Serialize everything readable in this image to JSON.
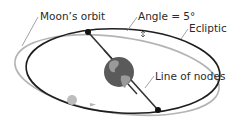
{
  "diagram": {
    "labels": {
      "moons_orbit": "Moon’s orbit",
      "angle": "Angle = 5°",
      "ecliptic": "Ecliptic",
      "line_of_nodes": "Line of nodes"
    },
    "colors": {
      "ecliptic": "#1e1e1e",
      "moon_orbit": "#b4b4b4",
      "earth": "#5a5a5a",
      "earth_land": "#9a9a9a",
      "moon": "#bdbdbd",
      "node": "#111111",
      "leader": "#8a8a8a"
    }
  }
}
